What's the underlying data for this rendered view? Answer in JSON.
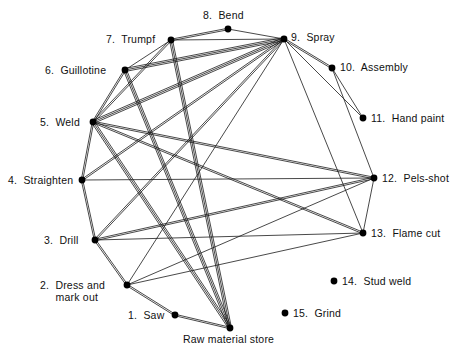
{
  "diagram": {
    "type": "process-relationship-network",
    "width": 458,
    "height": 358,
    "background_color": "#ffffff",
    "line_color": "#1a1a1a",
    "node_color": "#000000",
    "node_radius": 3.4,
    "nodes": [
      {
        "id": "n1",
        "label": "1.  Saw",
        "x": 175,
        "y": 315,
        "label_x": 128,
        "label_y": 309,
        "align": "label-right"
      },
      {
        "id": "n2",
        "label": "2.  Dress and\n     mark out",
        "x": 127,
        "y": 285,
        "label_x": 40,
        "label_y": 279,
        "align": "label-right"
      },
      {
        "id": "n3",
        "label": "3.  Drill",
        "x": 95,
        "y": 240,
        "label_x": 44,
        "label_y": 234,
        "align": "label-right"
      },
      {
        "id": "n4",
        "label": "4.  Straighten",
        "x": 82,
        "y": 180,
        "label_x": 8,
        "label_y": 174,
        "align": "label-right"
      },
      {
        "id": "n5",
        "label": "5.  Weld",
        "x": 93,
        "y": 122,
        "label_x": 40,
        "label_y": 116,
        "align": "label-right"
      },
      {
        "id": "n6",
        "label": "6.  Guillotine",
        "x": 125,
        "y": 70,
        "label_x": 45,
        "label_y": 64,
        "align": "label-right"
      },
      {
        "id": "n7",
        "label": "7.  Trumpf",
        "x": 171,
        "y": 40,
        "label_x": 106,
        "label_y": 33,
        "align": "label-right"
      },
      {
        "id": "n8",
        "label": "8.  Bend",
        "x": 228,
        "y": 29,
        "label_x": 203,
        "label_y": 9,
        "align": "label-right"
      },
      {
        "id": "n9",
        "label": "9.  Spray",
        "x": 284,
        "y": 39,
        "label_x": 291,
        "label_y": 31,
        "align": "label-right"
      },
      {
        "id": "n10",
        "label": "10.  Assembly",
        "x": 332,
        "y": 68,
        "label_x": 340,
        "label_y": 61,
        "align": "label-right"
      },
      {
        "id": "n11",
        "label": "11.  Hand paint",
        "x": 363,
        "y": 118,
        "label_x": 371,
        "label_y": 112,
        "align": "label-right"
      },
      {
        "id": "n12",
        "label": "12.  Pels-shot",
        "x": 374,
        "y": 178,
        "label_x": 382,
        "label_y": 172,
        "align": "label-right"
      },
      {
        "id": "n13",
        "label": "13.  Flame cut",
        "x": 363,
        "y": 233,
        "label_x": 371,
        "label_y": 227,
        "align": "label-right"
      },
      {
        "id": "n14",
        "label": "14.  Stud weld",
        "x": 334,
        "y": 281,
        "label_x": 342,
        "label_y": 275,
        "align": "label-right"
      },
      {
        "id": "n15",
        "label": "15.  Grind",
        "x": 285,
        "y": 313,
        "label_x": 293,
        "label_y": 307,
        "align": "label-right"
      },
      {
        "id": "n16",
        "label": "Raw material store",
        "x": 230,
        "y": 328,
        "label_x": 183,
        "label_y": 333,
        "align": "label-right"
      }
    ],
    "edges": [
      {
        "from": "n16",
        "to": "n1",
        "weight": 2
      },
      {
        "from": "n1",
        "to": "n2",
        "weight": 2
      },
      {
        "from": "n2",
        "to": "n3",
        "weight": 2
      },
      {
        "from": "n2",
        "to": "n9",
        "weight": 1
      },
      {
        "from": "n2",
        "to": "n12",
        "weight": 1
      },
      {
        "from": "n2",
        "to": "n13",
        "weight": 1
      },
      {
        "from": "n3",
        "to": "n4",
        "weight": 2
      },
      {
        "from": "n3",
        "to": "n9",
        "weight": 2
      },
      {
        "from": "n3",
        "to": "n12",
        "weight": 2
      },
      {
        "from": "n3",
        "to": "n13",
        "weight": 1
      },
      {
        "from": "n4",
        "to": "n5",
        "weight": 2
      },
      {
        "from": "n4",
        "to": "n9",
        "weight": 2
      },
      {
        "from": "n4",
        "to": "n12",
        "weight": 1
      },
      {
        "from": "n5",
        "to": "n6",
        "weight": 2
      },
      {
        "from": "n5",
        "to": "n7",
        "weight": 2
      },
      {
        "from": "n5",
        "to": "n9",
        "weight": 3
      },
      {
        "from": "n5",
        "to": "n12",
        "weight": 2
      },
      {
        "from": "n5",
        "to": "n13",
        "weight": 2
      },
      {
        "from": "n5",
        "to": "n16",
        "weight": 3
      },
      {
        "from": "n6",
        "to": "n7",
        "weight": 1
      },
      {
        "from": "n6",
        "to": "n9",
        "weight": 3
      },
      {
        "from": "n6",
        "to": "n16",
        "weight": 3
      },
      {
        "from": "n7",
        "to": "n8",
        "weight": 2
      },
      {
        "from": "n7",
        "to": "n9",
        "weight": 1
      },
      {
        "from": "n7",
        "to": "n16",
        "weight": 3
      },
      {
        "from": "n8",
        "to": "n9",
        "weight": 1
      },
      {
        "from": "n9",
        "to": "n10",
        "weight": 2
      },
      {
        "from": "n9",
        "to": "n11",
        "weight": 1
      },
      {
        "from": "n9",
        "to": "n13",
        "weight": 1
      },
      {
        "from": "n10",
        "to": "n11",
        "weight": 1
      },
      {
        "from": "n10",
        "to": "n12",
        "weight": 1
      },
      {
        "from": "n12",
        "to": "n13",
        "weight": 1
      }
    ]
  }
}
